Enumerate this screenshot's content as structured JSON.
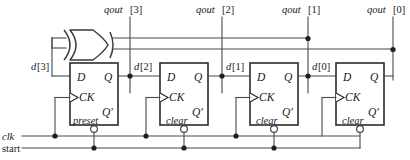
{
  "diagram": {
    "colors": {
      "wire": "#4a4a4a",
      "outline": "#2b2b2b",
      "background": "#ffffff",
      "junction": "#1e1e1e"
    },
    "outputs": [
      {
        "name": "qout3",
        "label_text": "qout",
        "index_text": "[3]"
      },
      {
        "name": "qout2",
        "label_text": "qout",
        "index_text": "[2]"
      },
      {
        "name": "qout1",
        "label_text": "qout",
        "index_text": "[1]"
      },
      {
        "name": "qout0",
        "label_text": "qout",
        "index_text": "[0]"
      }
    ],
    "data_nets": [
      {
        "name": "d3",
        "label_text": "d",
        "index_text": "[3]"
      },
      {
        "name": "d2",
        "label_text": "d",
        "index_text": "[2]"
      },
      {
        "name": "d1",
        "label_text": "d",
        "index_text": "[1]"
      },
      {
        "name": "d0",
        "label_text": "d",
        "index_text": "[0]"
      }
    ],
    "inputs": [
      {
        "name": "clk",
        "label": "clk",
        "style": "italic"
      },
      {
        "name": "start",
        "label": "start",
        "style": "roman"
      }
    ],
    "gate": {
      "name": "xor-gate",
      "type": "XOR",
      "input_count": 2
    },
    "flipflops": [
      {
        "name": "ff3",
        "d_label": "D",
        "q_label": "Q",
        "ck_label": "CK",
        "qn_label": "Q'",
        "mode_label": "preset"
      },
      {
        "name": "ff2",
        "d_label": "D",
        "q_label": "Q",
        "ck_label": "CK",
        "qn_label": "Q'",
        "mode_label": "clear"
      },
      {
        "name": "ff1",
        "d_label": "D",
        "q_label": "Q",
        "ck_label": "CK",
        "qn_label": "Q'",
        "mode_label": "clear"
      },
      {
        "name": "ff0",
        "d_label": "D",
        "q_label": "Q",
        "ck_label": "CK",
        "qn_label": "Q'",
        "mode_label": "clear"
      }
    ]
  }
}
